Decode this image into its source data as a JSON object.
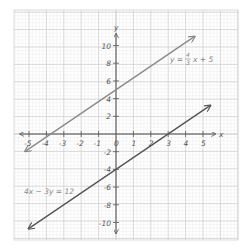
{
  "chart_data": {
    "type": "line",
    "title": "",
    "xlabel": "x",
    "ylabel": "y",
    "xlim": [
      -5.5,
      5.5
    ],
    "ylim": [
      -11,
      11
    ],
    "grid": true,
    "x_ticks": [
      "-5",
      "-4",
      "-3",
      "-2",
      "-1",
      "0",
      "1",
      "2",
      "3",
      "4",
      "5"
    ],
    "y_ticks": [
      "10",
      "8",
      "6",
      "4",
      "2",
      "-2",
      "-4",
      "-6",
      "-8",
      "-10"
    ],
    "series": [
      {
        "name": "y = 4/3 x + 5",
        "equation": "y = 4/3x + 5",
        "color": "#8a8a8a",
        "slope": 1.3333,
        "intercept": 5,
        "x": [
          -5.2,
          4.5
        ],
        "y": [
          -1.93,
          11.0
        ]
      },
      {
        "name": "4x - 3y = 12",
        "equation": "4x - 3y = 12",
        "color": "#555555",
        "slope": 1.3333,
        "intercept": -4,
        "x": [
          -5.0,
          5.4
        ],
        "y": [
          -10.67,
          3.2
        ]
      }
    ],
    "annotations": [
      {
        "text": "y = 4/3 x + 5",
        "x": 3.0,
        "y": 8.0
      },
      {
        "text": "4x − 3y = 12",
        "x": -4.5,
        "y": -6.5
      }
    ]
  },
  "labels": {
    "x_axis": "x",
    "y_axis": "y",
    "eq1_prefix": "y =",
    "eq1_num": "4",
    "eq1_den": "3",
    "eq1_suffix": "x + 5",
    "eq2": "4x − 3y = 12",
    "tick_x": [
      "-5",
      "-4",
      "-3",
      "-2",
      "-1",
      "0",
      "1",
      "2",
      "3",
      "4",
      "5"
    ],
    "tick_y_pos": [
      "10",
      "8",
      "6",
      "4",
      "2"
    ],
    "tick_y_neg": [
      "-2",
      "-4",
      "-6",
      "-8",
      "-10"
    ]
  },
  "colors": {
    "minor_grid": "#ececec",
    "major_grid": "#cfcfcf",
    "axis": "#555555",
    "line1": "#8a8a8a",
    "line2": "#555555"
  }
}
